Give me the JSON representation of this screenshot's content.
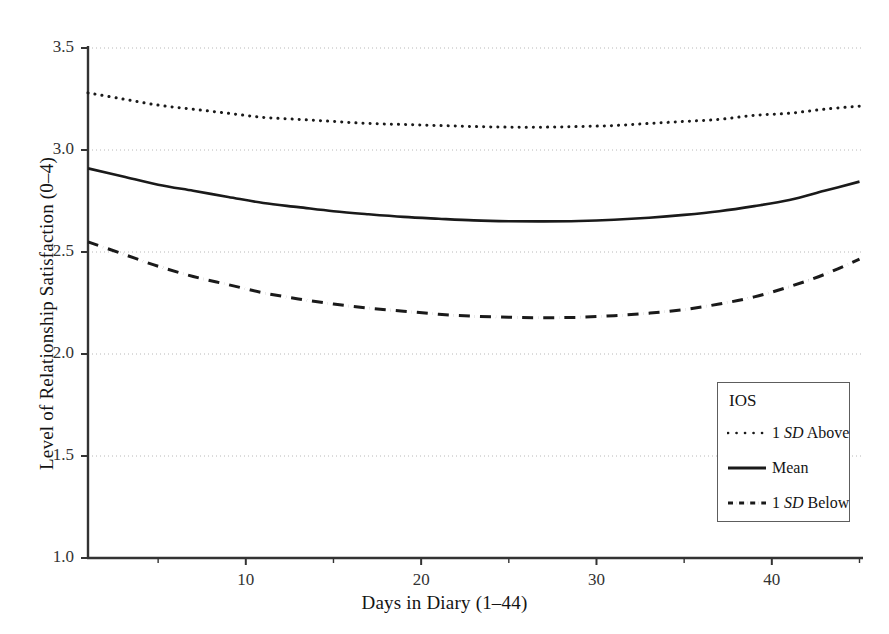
{
  "chart_data": {
    "type": "line",
    "title": "",
    "xlabel": "Days in Diary (1–44)",
    "ylabel": "Level of Relationship Satisfaction (0–4)",
    "xlim": [
      1,
      45.2
    ],
    "ylim": [
      1.0,
      3.5
    ],
    "xticks": [
      10,
      20,
      30,
      40
    ],
    "xtick_labels": [
      "10",
      "20",
      "30",
      "40"
    ],
    "yticks": [
      1.0,
      1.5,
      2.0,
      2.5,
      3.0,
      3.5
    ],
    "ytick_labels": [
      "1.0",
      "1.5",
      "2.0",
      "2.5",
      "3.0",
      "3.5"
    ],
    "grid": "horizontal-dotted",
    "legend_position": "inside-lower-right",
    "legend_title": "IOS",
    "x": [
      1,
      3,
      5,
      7,
      9,
      11,
      13,
      15,
      17,
      19,
      21,
      23,
      25,
      27,
      29,
      31,
      33,
      35,
      37,
      39,
      41,
      43,
      45
    ],
    "series": [
      {
        "name": "1 SD Above",
        "style": "dotted",
        "values": [
          3.28,
          3.25,
          3.22,
          3.2,
          3.18,
          3.16,
          3.15,
          3.14,
          3.13,
          3.125,
          3.12,
          3.115,
          3.112,
          3.112,
          3.115,
          3.12,
          3.13,
          3.14,
          3.15,
          3.17,
          3.18,
          3.2,
          3.215
        ]
      },
      {
        "name": "Mean",
        "style": "solid",
        "values": [
          2.91,
          2.87,
          2.83,
          2.8,
          2.77,
          2.74,
          2.72,
          2.7,
          2.685,
          2.672,
          2.663,
          2.655,
          2.651,
          2.65,
          2.652,
          2.658,
          2.668,
          2.682,
          2.7,
          2.725,
          2.755,
          2.8,
          2.845
        ]
      },
      {
        "name": "1 SD Below",
        "style": "dash-dot",
        "values": [
          2.55,
          2.49,
          2.43,
          2.38,
          2.34,
          2.3,
          2.27,
          2.245,
          2.225,
          2.21,
          2.195,
          2.185,
          2.18,
          2.178,
          2.18,
          2.188,
          2.2,
          2.218,
          2.245,
          2.28,
          2.33,
          2.39,
          2.465
        ]
      }
    ]
  },
  "legend": {
    "title": "IOS",
    "entries": [
      {
        "prefix": "1 ",
        "em": "SD",
        "suffix": " Above",
        "style": "dotted"
      },
      {
        "prefix": "",
        "em": "",
        "suffix": "Mean",
        "style": "solid"
      },
      {
        "prefix": "1 ",
        "em": "SD",
        "suffix": " Below",
        "style": "dash-dot"
      }
    ]
  },
  "colors": {
    "line": "#1a1a1a",
    "axis": "#333333",
    "grid": "#b8b8b8",
    "background": "#ffffff"
  }
}
